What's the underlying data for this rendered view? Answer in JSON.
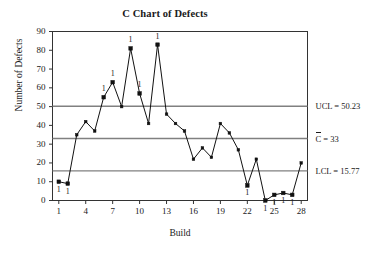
{
  "chart_data": {
    "type": "line",
    "title": "C Chart of Defects",
    "xlabel": "Build",
    "ylabel": "Number of Defects",
    "x": [
      1,
      2,
      3,
      4,
      5,
      6,
      7,
      8,
      9,
      10,
      11,
      12,
      13,
      14,
      15,
      16,
      17,
      18,
      19,
      20,
      21,
      22,
      23,
      24,
      25,
      26,
      27,
      28
    ],
    "values": [
      10,
      9,
      35,
      42,
      37,
      55,
      63,
      50,
      81,
      57,
      41,
      83,
      46,
      41,
      37,
      22,
      28,
      23,
      41,
      36,
      27,
      8,
      22,
      0,
      3,
      4,
      3,
      20
    ],
    "categories": [
      "1",
      "2",
      "3",
      "4",
      "5",
      "6",
      "7",
      "8",
      "9",
      "10",
      "11",
      "12",
      "13",
      "14",
      "15",
      "16",
      "17",
      "18",
      "19",
      "20",
      "21",
      "22",
      "23",
      "24",
      "25",
      "26",
      "27",
      "28"
    ],
    "series": [
      {
        "name": "Number of Defects",
        "values": [
          10,
          9,
          35,
          42,
          37,
          55,
          63,
          50,
          81,
          57,
          41,
          83,
          46,
          41,
          37,
          22,
          28,
          23,
          41,
          36,
          27,
          8,
          22,
          0,
          3,
          4,
          3,
          20
        ]
      }
    ],
    "xlim": [
      0.3,
      28.7
    ],
    "ylim": [
      0,
      90
    ],
    "ytick_values": [
      0,
      10,
      20,
      30,
      40,
      50,
      60,
      70,
      80,
      90
    ],
    "ytick_labels": [
      "0",
      "10",
      "20",
      "30",
      "40",
      "50",
      "60",
      "70",
      "80",
      "90"
    ],
    "xtick_values": [
      1,
      4,
      7,
      10,
      13,
      16,
      19,
      22,
      25,
      28
    ],
    "xtick_labels": [
      "1",
      "4",
      "7",
      "10",
      "13",
      "16",
      "19",
      "22",
      "25",
      "28"
    ],
    "grid": false,
    "legend": "none",
    "control_limits": [
      {
        "id": "ucl",
        "value": 50.23,
        "label": "UCL = 50.23"
      },
      {
        "id": "center",
        "value": 33,
        "label_prefix": "C",
        "label_suffix": " = 33"
      },
      {
        "id": "lcl",
        "value": 15.77,
        "label": "LCL = 15.77"
      }
    ],
    "violations": [
      {
        "x": 1,
        "y": 10,
        "label": "1",
        "side": "below"
      },
      {
        "x": 2,
        "y": 9,
        "label": "1",
        "side": "below"
      },
      {
        "x": 6,
        "y": 55,
        "label": "1",
        "side": "above"
      },
      {
        "x": 7,
        "y": 63,
        "label": "1",
        "side": "above"
      },
      {
        "x": 9,
        "y": 81,
        "label": "1",
        "side": "above"
      },
      {
        "x": 10,
        "y": 57,
        "label": "1",
        "side": "above"
      },
      {
        "x": 12,
        "y": 83,
        "label": "1",
        "side": "above"
      },
      {
        "x": 22,
        "y": 8,
        "label": "1",
        "side": "below"
      },
      {
        "x": 24,
        "y": 0,
        "label": "1",
        "side": "below"
      },
      {
        "x": 25,
        "y": 3,
        "label": "1",
        "side": "below"
      },
      {
        "x": 26,
        "y": 4,
        "label": "1",
        "side": "below"
      },
      {
        "x": 27,
        "y": 3,
        "label": "1",
        "side": "below"
      }
    ],
    "colors": {
      "series_line": "#111111",
      "marker": "#111111",
      "limit_line": "#808080",
      "axis": "#333333",
      "text": "#1a1a1a",
      "background": "#ffffff"
    }
  }
}
